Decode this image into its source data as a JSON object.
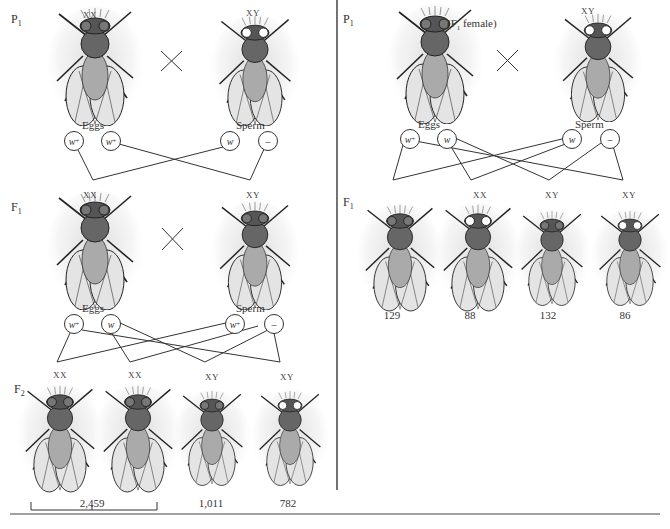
{
  "left_panel": {
    "p1": {
      "label": "P",
      "label_sub": "1",
      "female": {
        "sex": "XX",
        "eye": "red"
      },
      "male": {
        "sex": "XY",
        "eye": "white"
      },
      "cross_symbol": "×",
      "eggs_label": "Eggs",
      "sperm_label": "Sperm",
      "eggs": [
        {
          "allele": "w",
          "sup": "+"
        },
        {
          "allele": "w",
          "sup": "+"
        }
      ],
      "sperm": [
        {
          "allele": "w",
          "sup": ""
        },
        {
          "allele": "–",
          "sup": ""
        }
      ]
    },
    "f1": {
      "label": "F",
      "label_sub": "1",
      "female": {
        "sex": "XX",
        "eye": "red"
      },
      "male": {
        "sex": "XY",
        "eye": "red"
      },
      "cross_symbol": "×",
      "eggs_label": "Eggs",
      "sperm_label": "Sperm",
      "eggs": [
        {
          "allele": "w",
          "sup": "+"
        },
        {
          "allele": "w",
          "sup": ""
        }
      ],
      "sperm": [
        {
          "allele": "w",
          "sup": "+"
        },
        {
          "allele": "–",
          "sup": ""
        }
      ]
    },
    "f2": {
      "label": "F",
      "label_sub": "2",
      "offspring": [
        {
          "sex": "XX",
          "eye": "red"
        },
        {
          "sex": "XX",
          "eye": "red"
        },
        {
          "sex": "XY",
          "eye": "red"
        },
        {
          "sex": "XY",
          "eye": "white"
        }
      ],
      "counts": [
        "2,459",
        "1,011",
        "782"
      ]
    }
  },
  "right_panel": {
    "p1": {
      "label": "P",
      "label_sub": "1",
      "female_note": "(F",
      "female_note_sub": "1",
      "female_note_end": " female)",
      "female": {
        "sex": "",
        "eye": "red"
      },
      "male": {
        "sex": "XY",
        "eye": "white"
      },
      "cross_symbol": "×",
      "eggs_label": "Eggs",
      "sperm_label": "Sperm",
      "eggs": [
        {
          "allele": "w",
          "sup": "+"
        },
        {
          "allele": "w",
          "sup": ""
        }
      ],
      "sperm": [
        {
          "allele": "w",
          "sup": ""
        },
        {
          "allele": "–",
          "sup": ""
        }
      ]
    },
    "f1": {
      "label": "F",
      "label_sub": "1",
      "offspring": [
        {
          "sex": "",
          "eye": "red",
          "count": "129"
        },
        {
          "sex": "XX",
          "eye": "white",
          "count": "88"
        },
        {
          "sex": "XY",
          "eye": "red",
          "count": "132"
        },
        {
          "sex": "XY",
          "eye": "white",
          "count": "86"
        }
      ]
    }
  },
  "colors": {
    "line": "#333333",
    "wing": "#e6e6e6",
    "body": "#555555",
    "red_eye": "#777777",
    "white_eye": "#ffffff"
  }
}
